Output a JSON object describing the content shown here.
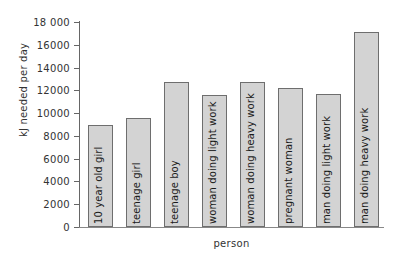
{
  "chart_data": {
    "type": "bar",
    "title": "",
    "xlabel": "person",
    "ylabel": "kJ needed per day",
    "categories": [
      "10 year old girl",
      "teenage girl",
      "teenage boy",
      "woman doing light work",
      "woman doing heavy work",
      "pregnant woman",
      "man doing light work",
      "man doing heavy work"
    ],
    "values": [
      9000,
      9600,
      12700,
      11600,
      12750,
      12200,
      11700,
      17150
    ],
    "ylim": [
      0,
      18000
    ],
    "ytick_step": 2000,
    "ytick_labels": [
      "0",
      "2000",
      "4000",
      "6000",
      "8000",
      "10000",
      "12000",
      "14000",
      "16000",
      "18 000"
    ],
    "ytick_values": [
      0,
      2000,
      4000,
      6000,
      8000,
      10000,
      12000,
      14000,
      16000,
      18000
    ],
    "grid": false,
    "legend": "none",
    "bar_fill_color": "#d3d3d3",
    "bar_border_color": "#6e6e6e",
    "axis_color": "#666666",
    "text_color": "#1a1a1a",
    "background_color": "#ffffff"
  }
}
